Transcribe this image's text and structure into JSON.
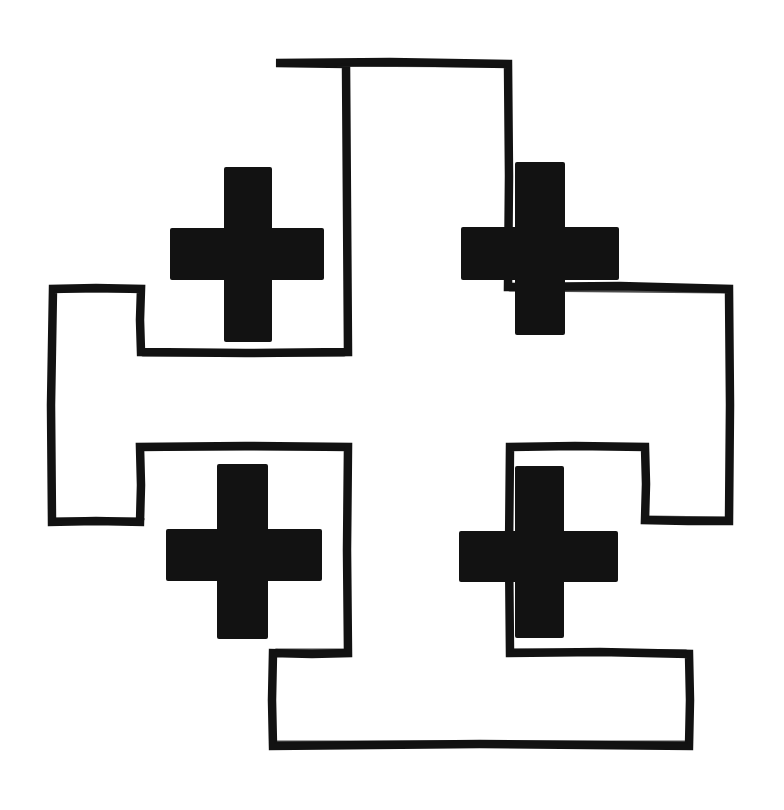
{
  "document": {
    "title": "Jerusalem Cross",
    "subject": "crusaders-cross-line-drawing",
    "canvas": {
      "width": 784,
      "height": 810
    },
    "background_color": "#ffffff",
    "ink_color": "#121212",
    "stroke_color": "#121212",
    "stroke_width": 8,
    "style": "hand-drawn ink outline with solid filled charges",
    "caption": "Jerusalem Cross: a large outlined cross potent with four small solid crosslets in the quadrants."
  },
  "artwork": {
    "name": "jerusalem-cross",
    "description": "Heraldic Jerusalem Cross (Crusader's Cross) drawn in black ink on white paper.",
    "elements": [
      {
        "name": "main-cross-outline",
        "type": "outlined-cross-potent",
        "fill": "#ffffff",
        "stroke": "#121212",
        "stroke_width": 8,
        "path": "M 275 62 L 508 63 L 509 286 L 648 287 L 649 288 L 730 288 L 730 521 L 645 521 L 645 447 L 509 446 L 510 653 L 592 653 L 592 653 L 689 653 L 689 745 L 273 745 L 273 653 L 347 653 L 347 446 L 140 446 L 140 522 L 52 522 L 52 288 L 140 288 L 140 352 L 347 352 L 347 134 Z",
        "outline_points": [
          [
            275,
            62
          ],
          [
            508,
            63
          ],
          [
            509,
            287
          ],
          [
            648,
            287
          ],
          [
            730,
            288
          ],
          [
            730,
            521
          ],
          [
            645,
            521
          ],
          [
            645,
            447
          ],
          [
            510,
            446
          ],
          [
            510,
            653
          ],
          [
            689,
            653
          ],
          [
            689,
            745
          ],
          [
            273,
            745
          ],
          [
            273,
            653
          ],
          [
            347,
            653
          ],
          [
            347,
            446
          ],
          [
            140,
            446
          ],
          [
            140,
            522
          ],
          [
            52,
            522
          ],
          [
            52,
            288
          ],
          [
            140,
            288
          ],
          [
            140,
            352
          ],
          [
            347,
            352
          ]
        ]
      },
      {
        "name": "crosslet-top-left",
        "type": "solid-greek-cross",
        "fill": "#121212",
        "vertical_bar": {
          "x": 224,
          "y": 167,
          "width": 48,
          "height": 175
        },
        "horizontal_bar": {
          "x": 170,
          "y": 228,
          "width": 154,
          "height": 52
        }
      },
      {
        "name": "crosslet-top-right",
        "type": "solid-greek-cross",
        "fill": "#121212",
        "vertical_bar": {
          "x": 515,
          "y": 162,
          "width": 50,
          "height": 173
        },
        "horizontal_bar": {
          "x": 461,
          "y": 227,
          "width": 158,
          "height": 53
        }
      },
      {
        "name": "crosslet-bottom-left",
        "type": "solid-greek-cross",
        "fill": "#121212",
        "vertical_bar": {
          "x": 217,
          "y": 464,
          "width": 51,
          "height": 175
        },
        "horizontal_bar": {
          "x": 166,
          "y": 529,
          "width": 156,
          "height": 52
        }
      },
      {
        "name": "crosslet-bottom-right",
        "type": "solid-greek-cross",
        "fill": "#121212",
        "vertical_bar": {
          "x": 515,
          "y": 466,
          "width": 49,
          "height": 172
        },
        "horizontal_bar": {
          "x": 459,
          "y": 531,
          "width": 159,
          "height": 51
        }
      }
    ]
  }
}
